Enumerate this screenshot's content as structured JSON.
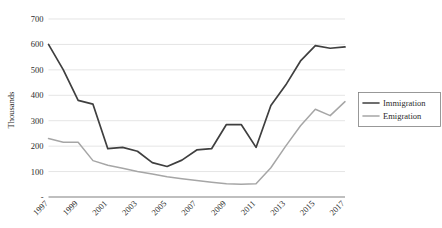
{
  "chart_data": {
    "type": "line",
    "title": "",
    "xlabel": "",
    "ylabel": "Thousands",
    "ylim": [
      0,
      700
    ],
    "ytick_labels": [
      "-",
      "100",
      "200",
      "300",
      "400",
      "500",
      "600",
      "700"
    ],
    "ytick_values": [
      0,
      100,
      200,
      300,
      400,
      500,
      600,
      700
    ],
    "grid": true,
    "legend_position": "right",
    "x": [
      1997,
      1998,
      1999,
      2000,
      2001,
      2002,
      2003,
      2004,
      2005,
      2006,
      2007,
      2008,
      2009,
      2010,
      2011,
      2012,
      2013,
      2014,
      2015,
      2016,
      2017
    ],
    "xtick_labels": [
      "1997",
      "1999",
      "2001",
      "2003",
      "2005",
      "2007",
      "2009",
      "2011",
      "2013",
      "2015",
      "2017"
    ],
    "xtick_values": [
      1997,
      1999,
      2001,
      2003,
      2005,
      2007,
      2009,
      2011,
      2013,
      2015,
      2017
    ],
    "series": [
      {
        "name": "Immigration",
        "color": "#3f3f3f",
        "values": [
          600,
          500,
          380,
          365,
          190,
          195,
          180,
          135,
          120,
          145,
          185,
          190,
          285,
          285,
          195,
          360,
          440,
          535,
          595,
          585,
          590
        ]
      },
      {
        "name": "Emigration",
        "color": "#a6a6a6",
        "values": [
          230,
          215,
          215,
          143,
          125,
          113,
          100,
          90,
          80,
          72,
          65,
          58,
          52,
          50,
          52,
          115,
          200,
          280,
          345,
          320,
          375
        ]
      }
    ]
  },
  "legend": {
    "entries": [
      {
        "label": "Immigration"
      },
      {
        "label": "Emigration"
      }
    ]
  },
  "axis": {
    "y_title": "Thousands"
  }
}
